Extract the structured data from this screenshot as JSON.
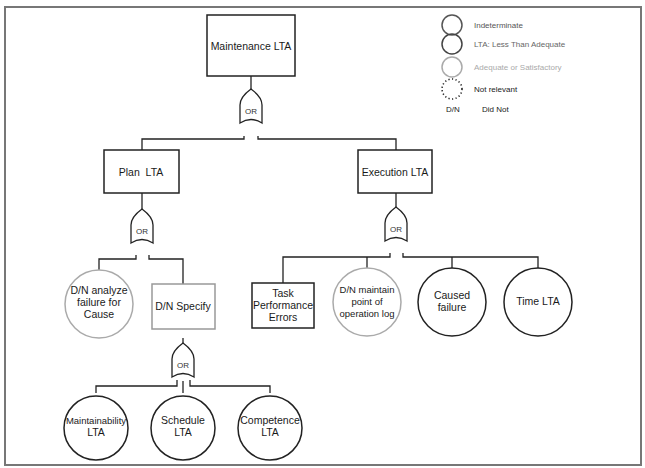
{
  "title": "Maintenance LTA",
  "colors": {
    "indeterminate": "#555555",
    "lta": "#444444",
    "adequate": "#aaaaaa",
    "not_relevant": "#222222",
    "frame": "#777777"
  },
  "legend": {
    "items": [
      {
        "symbol": "circle-dark",
        "label": "Indeterminate"
      },
      {
        "symbol": "circle-medium",
        "label": "LTA: Less Than Adequate"
      },
      {
        "symbol": "circle-light",
        "label": "Adequate or Satisfactory"
      },
      {
        "symbol": "circle-dotted",
        "label": "Not relevant"
      }
    ],
    "abbrev": {
      "key": "D/N",
      "value": "Did Not"
    }
  },
  "nodes": {
    "root": {
      "label": "Maintenance LTA",
      "shape": "rectangle"
    },
    "plan": {
      "label": "Plan  LTA",
      "shape": "rectangle"
    },
    "execution": {
      "label": "Execution LTA",
      "shape": "rectangle"
    },
    "dn_analyze": {
      "lines": [
        "D/N analyze",
        "failure for",
        "Cause"
      ],
      "shape": "circle",
      "status": "adequate"
    },
    "dn_specify": {
      "label": "D/N Specify",
      "shape": "rectangle",
      "status": "adequate"
    },
    "task_perf": {
      "lines": [
        "Task",
        "Performance",
        "Errors"
      ],
      "shape": "rectangle"
    },
    "dn_maintain": {
      "lines": [
        "D/N maintain",
        "point of",
        "operation log"
      ],
      "shape": "circle",
      "status": "adequate"
    },
    "caused_failure": {
      "lines": [
        "Caused",
        "failure"
      ],
      "shape": "circle"
    },
    "time_lta": {
      "label": "Time LTA",
      "shape": "circle"
    },
    "maintainability": {
      "lines": [
        "Maintainability",
        "LTA"
      ],
      "shape": "circle"
    },
    "schedule": {
      "lines": [
        "Schedule",
        "LTA"
      ],
      "shape": "circle"
    },
    "competence": {
      "lines": [
        "Competence",
        "LTA"
      ],
      "shape": "circle"
    }
  },
  "gates": {
    "g1": "OR",
    "g2": "OR",
    "g3": "OR",
    "g4": "OR"
  }
}
